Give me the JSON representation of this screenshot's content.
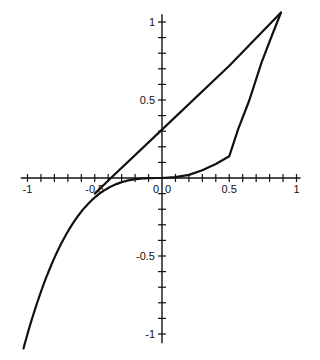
{
  "chart_data": {
    "type": "line",
    "title": "",
    "xlabel": "",
    "ylabel": "",
    "xlim": [
      -1.05,
      1.0
    ],
    "ylim": [
      -1.08,
      1.08
    ],
    "grid": false,
    "legend": null,
    "x_ticks": {
      "major": [
        -1,
        -0.5,
        0,
        0.5,
        1
      ],
      "minor_step": 0.1
    },
    "y_ticks": {
      "major": [
        -1,
        -0.5,
        0,
        0.5,
        1
      ],
      "minor_step": 0.1
    },
    "x_tick_labels": [
      "-1",
      "-0.5",
      "0",
      "0.5",
      "1"
    ],
    "y_tick_labels": [
      "-1",
      "-0.5",
      "0",
      "0.5",
      "1"
    ],
    "series": [
      {
        "name": "cubic curve (left branch, y = x^3)",
        "x": [
          -1.05,
          -0.9,
          -0.8,
          -0.7,
          -0.6,
          -0.5,
          -0.4,
          -0.3,
          -0.2,
          -0.1,
          0.0
        ],
        "y": [
          -1.08,
          -0.73,
          -0.51,
          -0.34,
          -0.22,
          -0.13,
          -0.064,
          -0.027,
          -0.008,
          -0.001,
          0.0
        ]
      },
      {
        "name": "right curve",
        "x": [
          0.0,
          0.1,
          0.2,
          0.3,
          0.4,
          0.5,
          0.565,
          0.65,
          0.74,
          0.82,
          0.885
        ],
        "y": [
          0.0,
          0.005,
          0.02,
          0.05,
          0.09,
          0.14,
          0.31,
          0.5,
          0.74,
          0.92,
          1.06
        ]
      },
      {
        "name": "tangent line",
        "x": [
          -0.5,
          -0.38,
          0.0,
          0.5,
          0.885
        ],
        "y": [
          -0.1,
          0.0,
          0.31,
          0.72,
          1.06
        ]
      }
    ],
    "annotations": []
  },
  "axes": {
    "x_labels": [
      "-1",
      "-0.5",
      "0",
      "0.5",
      "1"
    ],
    "y_labels": [
      "1",
      "0.5",
      "0",
      "-0.5",
      "-1"
    ]
  }
}
